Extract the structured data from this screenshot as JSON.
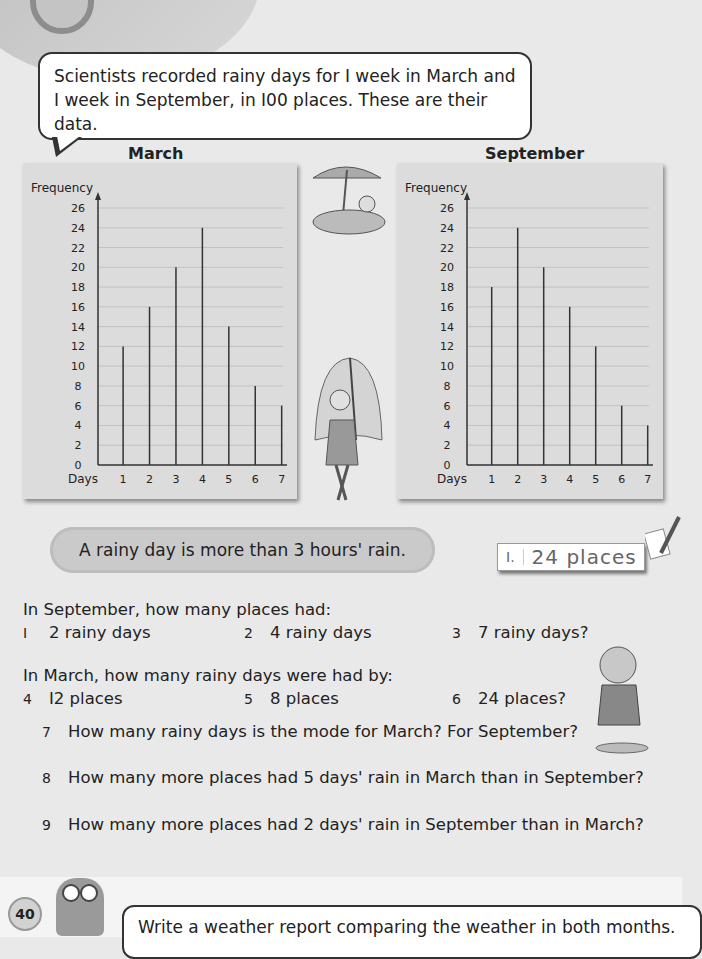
{
  "intro": {
    "line1": "Scientists recorded rainy days for I week in March and",
    "line2": "I week in September, in I00 places. These are their data."
  },
  "chart_data": [
    {
      "type": "bar",
      "title": "March",
      "xlabel": "Days",
      "ylabel": "Frequency",
      "categories": [
        "1",
        "2",
        "3",
        "4",
        "5",
        "6",
        "7"
      ],
      "values": [
        12,
        16,
        20,
        24,
        14,
        8,
        6
      ],
      "ylim": [
        0,
        26
      ],
      "yticks": [
        0,
        2,
        4,
        6,
        8,
        10,
        12,
        14,
        16,
        18,
        20,
        22,
        24,
        26
      ],
      "grid": true
    },
    {
      "type": "bar",
      "title": "September",
      "xlabel": "Days",
      "ylabel": "Frequency",
      "categories": [
        "1",
        "2",
        "3",
        "4",
        "5",
        "6",
        "7"
      ],
      "values": [
        18,
        24,
        20,
        16,
        12,
        6,
        4
      ],
      "ylim": [
        0,
        26
      ],
      "yticks": [
        0,
        2,
        4,
        6,
        8,
        10,
        12,
        14,
        16,
        18,
        20,
        22,
        24,
        26
      ],
      "grid": true
    }
  ],
  "charts": {
    "march_title": "March",
    "september_title": "September"
  },
  "note": "A rainy day is more than 3 hours' rain.",
  "answer_example": {
    "num": "I.",
    "value": "24 places"
  },
  "section1": {
    "heading": "In September, how many places had:",
    "items": [
      {
        "n": "I",
        "text": "2 rainy days"
      },
      {
        "n": "2",
        "text": "4 rainy days"
      },
      {
        "n": "3",
        "text": "7 rainy days?"
      }
    ]
  },
  "section2": {
    "heading": "In March, how many rainy days were had by:",
    "items": [
      {
        "n": "4",
        "text": "I2 places"
      },
      {
        "n": "5",
        "text": "8 places"
      },
      {
        "n": "6",
        "text": "24 places?"
      }
    ]
  },
  "questions": [
    {
      "n": "7",
      "text": "How many rainy days is the mode for March? For September?"
    },
    {
      "n": "8",
      "text": "How many more places had 5 days' rain in March than in September?"
    },
    {
      "n": "9",
      "text": "How many more places had 2 days' rain in September than in March?"
    }
  ],
  "task": "Write a weather report comparing the weather in both months.",
  "page_number": "40"
}
